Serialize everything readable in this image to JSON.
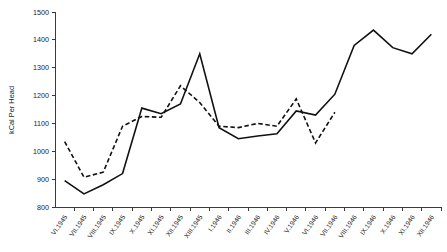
{
  "chart_data": {
    "type": "line",
    "title": "",
    "xlabel": "",
    "ylabel": "kCal Per Head",
    "ylim": [
      800,
      1500
    ],
    "ytick_values": [
      800,
      900,
      1000,
      1100,
      1200,
      1300,
      1400,
      1500
    ],
    "ytick_labels": [
      "800",
      "900",
      "1000",
      "1100",
      "1200",
      "1300",
      "1400",
      "1500"
    ],
    "grid": false,
    "legend": "none",
    "categories": [
      "VI.1945",
      "VII.1945",
      "VIII.1945",
      "IX.1945",
      "X.1945",
      "XI.1945",
      "XII.1945",
      "XIII.1945",
      "I.1946",
      "II.1946",
      "III.1946",
      "IV.1946",
      "V.1946",
      "VI.1946",
      "VII.1946",
      "VIII.1946",
      "IX.1946",
      "X.1946",
      "XI.1946",
      "XII.1946"
    ],
    "series": [
      {
        "name": "solid-series",
        "style": "solid",
        "values": [
          895,
          847,
          880,
          920,
          1155,
          1135,
          1170,
          1350,
          1085,
          1045,
          1055,
          1063,
          1145,
          1130,
          1205,
          1380,
          1435,
          1372,
          1350,
          1420
        ]
      },
      {
        "name": "dashed-series",
        "style": "dashed",
        "values": [
          1035,
          907,
          925,
          1090,
          1125,
          1122,
          1235,
          1175,
          1090,
          1085,
          1100,
          1090,
          1188,
          1030,
          1140,
          null,
          null,
          null,
          null,
          null
        ]
      }
    ]
  }
}
